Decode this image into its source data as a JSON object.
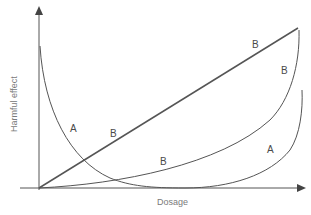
{
  "diagram": {
    "y_axis_label": "Harmful effect",
    "x_axis_label": "Dosage",
    "curves": [
      {
        "id": "A-left",
        "label": "A",
        "description": "decreasing curve from high harm at low dose"
      },
      {
        "id": "B-straight",
        "label": "B",
        "description": "straight line rising linearly"
      },
      {
        "id": "B-curve",
        "label": "B",
        "description": "upward curve from origin"
      },
      {
        "id": "A-right",
        "label": "A",
        "description": "rising curve at high dose"
      }
    ],
    "labels": {
      "a_left": "A",
      "b_line": "B",
      "b_line_top": "B",
      "b_curve_top": "B",
      "b_curve_mid": "B",
      "a_right": "A"
    }
  },
  "colors": {
    "axis": "#555555",
    "line": "#555555",
    "text": "#4a4a4a"
  }
}
